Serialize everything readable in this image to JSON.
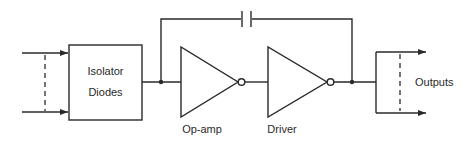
{
  "diagram": {
    "type": "block-circuit-diagram",
    "blocks": {
      "isolator": {
        "line1": "Isolator",
        "line2": "Diodes"
      },
      "opamp": {
        "label": "Op-amp"
      },
      "driver": {
        "label": "Driver"
      }
    },
    "outputs_label": "Outputs",
    "components": [
      "inputs",
      "isolator-diodes",
      "op-amp (inverting)",
      "driver (inverting)",
      "feedback-capacitor",
      "outputs"
    ],
    "connections": [
      [
        "inputs",
        "isolator-diodes"
      ],
      [
        "isolator-diodes",
        "op-amp"
      ],
      [
        "op-amp",
        "driver"
      ],
      [
        "driver",
        "outputs"
      ],
      [
        "driver-output",
        "feedback-capacitor"
      ],
      [
        "feedback-capacitor",
        "op-amp-input"
      ]
    ]
  }
}
